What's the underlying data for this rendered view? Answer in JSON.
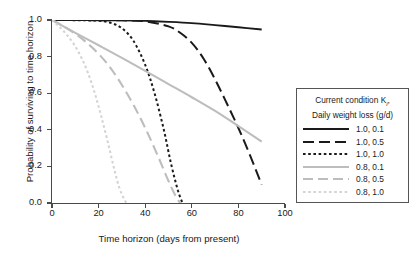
{
  "chart_data": {
    "type": "line",
    "title": "",
    "xlabel": "Time horizon (days from present)",
    "ylabel": "Probability of surviving to time horizon",
    "xlim": [
      0,
      100
    ],
    "ylim": [
      0,
      1
    ],
    "xticks": [
      "0",
      "20",
      "40",
      "60",
      "80",
      "100"
    ],
    "xtick_values": [
      0,
      20,
      40,
      60,
      80,
      100
    ],
    "yticks": [
      "0.0",
      "0.2",
      "0.4",
      "0.6",
      "0.8",
      "1.0"
    ],
    "ytick_values": [
      0,
      0.2,
      0.4,
      0.6,
      0.8,
      1.0
    ],
    "grid": false,
    "legend_position": "right-outside",
    "legend_title_line1": "Current condition K",
    "legend_title_subscript": "i",
    "legend_title_line1_suffix": ",",
    "legend_title_line2": "Daily weight loss (g/d)",
    "series": [
      {
        "name": "1.0, 0.1",
        "condition": 1.0,
        "weight_loss": 0.1,
        "color": "#1a1a1a",
        "style": "solid",
        "dash": "none",
        "width": 1.9,
        "x": [
          0,
          10,
          20,
          30,
          40,
          50,
          60,
          70,
          80,
          90
        ],
        "y": [
          1.0,
          1.0,
          0.999,
          0.998,
          0.995,
          0.99,
          0.983,
          0.972,
          0.96,
          0.948
        ]
      },
      {
        "name": "1.0, 0.5",
        "condition": 1.0,
        "weight_loss": 0.5,
        "color": "#1a1a1a",
        "style": "long-dash",
        "dash": "11 5",
        "width": 2.0,
        "x": [
          0,
          10,
          20,
          30,
          40,
          50,
          55,
          60,
          65,
          70,
          75,
          80,
          85,
          90
        ],
        "y": [
          1.0,
          1.0,
          0.999,
          0.998,
          0.993,
          0.965,
          0.93,
          0.875,
          0.79,
          0.675,
          0.545,
          0.41,
          0.26,
          0.1
        ]
      },
      {
        "name": "1.0, 1.0",
        "condition": 1.0,
        "weight_loss": 1.0,
        "color": "#1a1a1a",
        "style": "dotted",
        "dash": "2.6 2.6",
        "width": 2.0,
        "x": [
          0,
          5,
          10,
          15,
          20,
          25,
          30,
          35,
          40,
          44,
          48,
          51,
          54,
          56
        ],
        "y": [
          1.0,
          1.0,
          0.999,
          0.998,
          0.996,
          0.985,
          0.955,
          0.885,
          0.755,
          0.6,
          0.4,
          0.22,
          0.07,
          0.0
        ]
      },
      {
        "name": "0.8, 0.1",
        "condition": 0.8,
        "weight_loss": 0.1,
        "color": "#bdbdbd",
        "style": "solid",
        "dash": "none",
        "width": 2.1,
        "x": [
          0,
          10,
          20,
          30,
          40,
          50,
          60,
          70,
          80,
          90
        ],
        "y": [
          1.0,
          0.93,
          0.862,
          0.793,
          0.722,
          0.65,
          0.578,
          0.503,
          0.42,
          0.335
        ]
      },
      {
        "name": "0.8, 0.5",
        "condition": 0.8,
        "weight_loss": 0.5,
        "color": "#bdbdbd",
        "style": "long-dash",
        "dash": "10 5",
        "width": 2.1,
        "x": [
          0,
          5,
          10,
          15,
          20,
          25,
          30,
          35,
          40,
          45,
          50,
          53,
          55
        ],
        "y": [
          1.0,
          0.965,
          0.925,
          0.875,
          0.815,
          0.74,
          0.645,
          0.535,
          0.41,
          0.27,
          0.12,
          0.04,
          0.0
        ]
      },
      {
        "name": "0.8, 1.0",
        "condition": 0.8,
        "weight_loss": 1.0,
        "color": "#d4d4d4",
        "style": "dotted",
        "dash": "2.6 2.6",
        "width": 2.1,
        "x": [
          0,
          3,
          6,
          9,
          12,
          15,
          18,
          21,
          24,
          27,
          29,
          31,
          32
        ],
        "y": [
          1.0,
          0.965,
          0.925,
          0.875,
          0.81,
          0.725,
          0.615,
          0.48,
          0.33,
          0.17,
          0.08,
          0.02,
          0.0
        ]
      }
    ]
  }
}
